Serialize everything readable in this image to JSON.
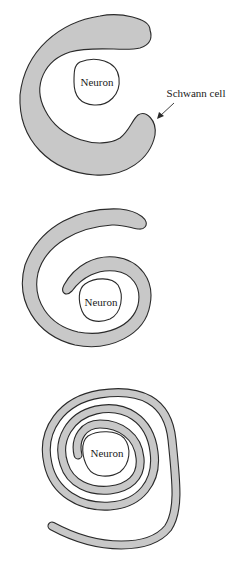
{
  "figure": {
    "panels": [
      {
        "id": "stage-1",
        "description": "Schwann cell begins to wrap around neuron axon (C-shape)",
        "neuron_label": "Neuron",
        "callout_label": "Schwann cell"
      },
      {
        "id": "stage-2",
        "description": "Schwann cell wraps around neuron about one and a half turns",
        "neuron_label": "Neuron"
      },
      {
        "id": "stage-3",
        "description": "Schwann cell forms multiple concentric wraps (myelin sheath)",
        "neuron_label": "Neuron"
      }
    ],
    "colors": {
      "sheath_fill": "#c8c8c8",
      "outline": "#2a2a2a",
      "background": "#ffffff"
    }
  }
}
